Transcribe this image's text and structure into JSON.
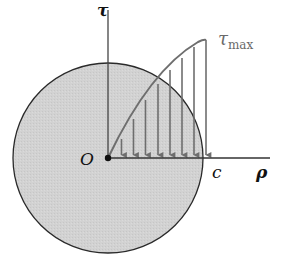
{
  "figure": {
    "labels": {
      "tau_axis": "τ",
      "tau_max_symbol": "τ",
      "tau_max_sub": "max",
      "origin": "O",
      "radius_end": "c",
      "rho_axis": "ρ"
    },
    "colors": {
      "cross_section_fill": "#d4d4d4",
      "outline": "#2a2a2a",
      "axes": "#333333",
      "stress_arrows": "#6e6e6e",
      "tau_max_label": "#6a6a6a"
    },
    "geometry": {
      "circle_center": [
        108,
        158
      ],
      "circle_radius": 95,
      "arrow_count": 8
    }
  }
}
